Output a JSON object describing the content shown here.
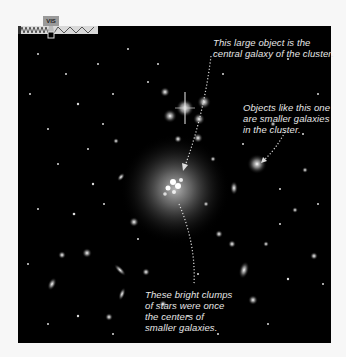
{
  "figure": {
    "band_indicator": {
      "label": "VIS",
      "icon": "wavelength-spectrum-icon"
    },
    "callouts": [
      {
        "id": "central-galaxy",
        "lines": [
          "This large object is the",
          "central galaxy of the cluster."
        ]
      },
      {
        "id": "smaller-galaxies",
        "lines": [
          "Objects like this one",
          "are smaller galaxies",
          "in the cluster."
        ]
      },
      {
        "id": "star-clumps",
        "lines": [
          "These bright clumps",
          "of stars were once",
          "the centers of",
          "smaller galaxies."
        ]
      }
    ],
    "colors": {
      "background": "#f7f7f7",
      "sky": "#000000",
      "text": "#e6e6e6",
      "arrow": "#dddddd"
    }
  }
}
